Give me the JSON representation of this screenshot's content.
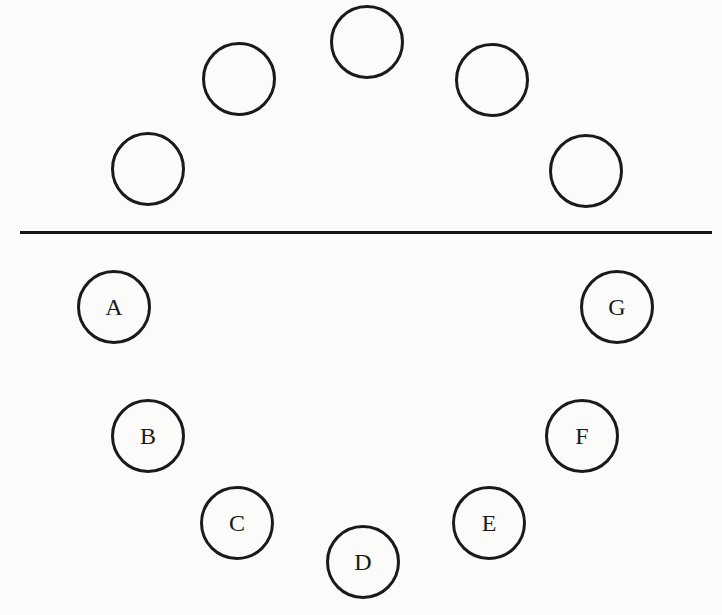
{
  "diagram": {
    "top_circles": [
      {
        "cx": 147,
        "cy": 168,
        "label": ""
      },
      {
        "cx": 238,
        "cy": 78,
        "label": ""
      },
      {
        "cx": 366,
        "cy": 41,
        "label": ""
      },
      {
        "cx": 491,
        "cy": 79,
        "label": ""
      },
      {
        "cx": 585,
        "cy": 170,
        "label": ""
      }
    ],
    "divider": {
      "x1": 20,
      "x2": 712,
      "y": 232
    },
    "bottom_circles": [
      {
        "cx": 113,
        "cy": 306,
        "label": "A"
      },
      {
        "cx": 147,
        "cy": 435,
        "label": "B"
      },
      {
        "cx": 236,
        "cy": 522,
        "label": "C"
      },
      {
        "cx": 362,
        "cy": 561,
        "label": "D"
      },
      {
        "cx": 488,
        "cy": 522,
        "label": "E"
      },
      {
        "cx": 581,
        "cy": 435,
        "label": "F"
      },
      {
        "cx": 616,
        "cy": 306,
        "label": "G"
      }
    ],
    "circle_radius": 36,
    "stroke_color": "#1a1a1a"
  }
}
